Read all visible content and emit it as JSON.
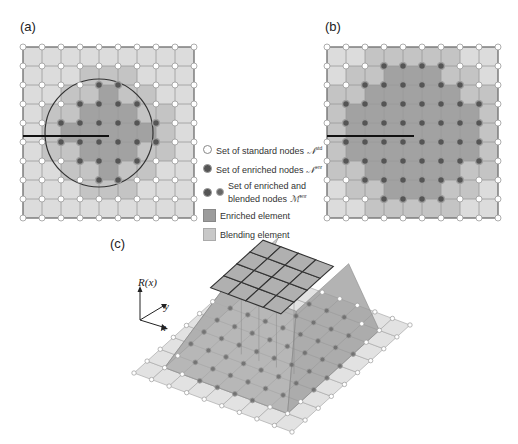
{
  "panels": {
    "a": {
      "label": "(a)"
    },
    "b": {
      "label": "(b)"
    },
    "c": {
      "label": "(c)"
    }
  },
  "legend": {
    "items": [
      {
        "icon": "standard-node",
        "text": "Set of standard nodes ",
        "symbol": "𝒩",
        "sup": "std"
      },
      {
        "icon": "enriched-node",
        "text": "Set of enriched nodes ",
        "symbol": "𝒩",
        "sup": "enr"
      },
      {
        "icon": "enriched-blended-node",
        "text": "Set of enriched and blended nodes ",
        "symbol": "ℳ",
        "sup": "enr"
      },
      {
        "icon": "enriched-element",
        "text": "Enriched element"
      },
      {
        "icon": "blending-element",
        "text": "Blending element"
      }
    ]
  },
  "axes3d": {
    "z": "R(x)",
    "y": "y",
    "x": "x"
  },
  "colors": {
    "standard_element": "#dcdcdc",
    "blending_element": "#c4c4c4",
    "enriched_element": "#a2a2a2",
    "standard_node": "#ffffff",
    "enriched_node": "#555555",
    "grid_line": "#9a9a9a"
  },
  "grid": {
    "nodes_per_side": 10,
    "elements_per_side": 9
  },
  "enriched_nodes_a": [
    [
      2,
      4
    ],
    [
      2,
      5
    ],
    [
      3,
      3
    ],
    [
      3,
      4
    ],
    [
      3,
      5
    ],
    [
      3,
      6
    ],
    [
      4,
      2
    ],
    [
      4,
      3
    ],
    [
      4,
      4
    ],
    [
      4,
      5
    ],
    [
      4,
      6
    ],
    [
      4,
      7
    ],
    [
      5,
      2
    ],
    [
      5,
      3
    ],
    [
      5,
      4
    ],
    [
      5,
      5
    ],
    [
      5,
      6
    ],
    [
      5,
      7
    ],
    [
      6,
      3
    ],
    [
      6,
      4
    ],
    [
      6,
      5
    ],
    [
      6,
      6
    ],
    [
      7,
      4
    ],
    [
      7,
      5
    ]
  ],
  "enriched_nodes_b": [
    [
      1,
      3
    ],
    [
      1,
      4
    ],
    [
      1,
      5
    ],
    [
      1,
      6
    ],
    [
      2,
      2
    ],
    [
      2,
      3
    ],
    [
      2,
      4
    ],
    [
      2,
      5
    ],
    [
      2,
      6
    ],
    [
      2,
      7
    ],
    [
      3,
      1
    ],
    [
      3,
      2
    ],
    [
      3,
      3
    ],
    [
      3,
      4
    ],
    [
      3,
      5
    ],
    [
      3,
      6
    ],
    [
      3,
      7
    ],
    [
      3,
      8
    ],
    [
      4,
      1
    ],
    [
      4,
      2
    ],
    [
      4,
      3
    ],
    [
      4,
      4
    ],
    [
      4,
      5
    ],
    [
      4,
      6
    ],
    [
      4,
      7
    ],
    [
      4,
      8
    ],
    [
      5,
      1
    ],
    [
      5,
      2
    ],
    [
      5,
      3
    ],
    [
      5,
      4
    ],
    [
      5,
      5
    ],
    [
      5,
      6
    ],
    [
      5,
      7
    ],
    [
      5,
      8
    ],
    [
      6,
      1
    ],
    [
      6,
      2
    ],
    [
      6,
      3
    ],
    [
      6,
      4
    ],
    [
      6,
      5
    ],
    [
      6,
      6
    ],
    [
      6,
      7
    ],
    [
      6,
      8
    ],
    [
      7,
      2
    ],
    [
      7,
      3
    ],
    [
      7,
      4
    ],
    [
      7,
      5
    ],
    [
      7,
      6
    ],
    [
      7,
      7
    ],
    [
      8,
      3
    ],
    [
      8,
      4
    ],
    [
      8,
      5
    ],
    [
      8,
      6
    ]
  ]
}
